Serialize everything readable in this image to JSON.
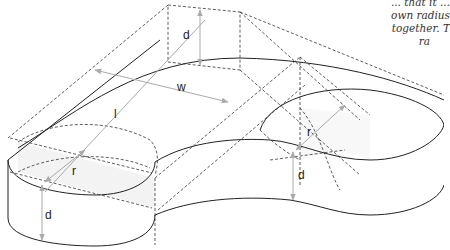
{
  "caption": {
    "lines": [
      "... that it ...",
      "own radius",
      "together. T",
      "ra"
    ]
  },
  "labels": {
    "d_top": "d",
    "w": "w",
    "l": "l",
    "r_left": "r",
    "d_left": "d",
    "r_right": "r",
    "d_right": "d"
  },
  "colors": {
    "solid_line": "#222222",
    "dashed_line": "#333333",
    "dimension_arrow": "#aaaaaa",
    "fill": "#f4f4f4"
  }
}
